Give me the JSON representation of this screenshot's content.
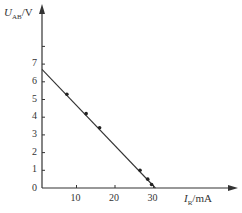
{
  "chart_data": {
    "type": "scatter",
    "title": "",
    "xlabel": "I_R/mA",
    "ylabel": "U_AB/V",
    "xlabel_main": "I",
    "xlabel_sub": "R",
    "xlabel_unit": "/mA",
    "ylabel_main": "U",
    "ylabel_sub": "AB",
    "ylabel_unit": "/V",
    "x_ticks": [
      "10",
      "20",
      "30"
    ],
    "y_ticks": [
      "1",
      "2",
      "3",
      "4",
      "5",
      "6",
      "7"
    ],
    "origin_label": "0",
    "xlim": [
      0,
      35
    ],
    "ylim": [
      0,
      8
    ],
    "grid": false,
    "points": [
      {
        "x": 7.5,
        "y": 5.3
      },
      {
        "x": 12.5,
        "y": 4.2
      },
      {
        "x": 16,
        "y": 3.4
      },
      {
        "x": 26.5,
        "y": 1.0
      },
      {
        "x": 28.5,
        "y": 0.5
      },
      {
        "x": 29.5,
        "y": 0.2
      }
    ],
    "fit_line": {
      "x": [
        0,
        30.5
      ],
      "y": [
        6.7,
        0
      ]
    }
  }
}
